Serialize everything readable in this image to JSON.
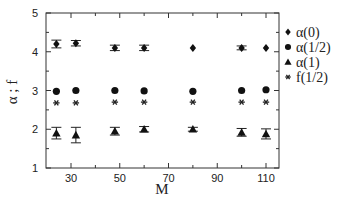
{
  "chart_data": {
    "type": "scatter",
    "title": "",
    "xlabel": "M",
    "ylabel": "α ; f",
    "xlim": [
      20,
      115
    ],
    "ylim": [
      1,
      5
    ],
    "x_ticks": [
      30,
      50,
      70,
      90,
      110
    ],
    "x_minor_ticks": [
      40,
      60,
      80,
      100
    ],
    "y_ticks": [
      1,
      2,
      3,
      4,
      5
    ],
    "grid": false,
    "legend_position": "right",
    "x": [
      24,
      32,
      48,
      60,
      80,
      100,
      110
    ],
    "series": [
      {
        "name": "α(0)",
        "marker": "diamond",
        "values": [
          4.2,
          4.22,
          4.1,
          4.1,
          4.1,
          4.1,
          4.1
        ],
        "errors": [
          0.1,
          0.07,
          0.07,
          0.07,
          0.03,
          0.05,
          0.03
        ]
      },
      {
        "name": "α(1/2)",
        "marker": "circle",
        "values": [
          2.98,
          3.0,
          3.0,
          2.99,
          2.98,
          3.0,
          3.02
        ],
        "errors": [
          0.02,
          0.02,
          0.02,
          0.02,
          0.02,
          0.02,
          0.02
        ]
      },
      {
        "name": "α(1)",
        "marker": "triangle",
        "values": [
          1.9,
          1.85,
          1.95,
          2.0,
          2.0,
          1.92,
          1.88
        ],
        "errors": [
          0.15,
          0.2,
          0.1,
          0.07,
          0.05,
          0.1,
          0.13
        ]
      },
      {
        "name": "f(1/2)",
        "marker": "asterisk",
        "values": [
          2.68,
          2.68,
          2.7,
          2.7,
          2.7,
          2.7,
          2.7
        ],
        "errors": [
          0.02,
          0.02,
          0.02,
          0.02,
          0.02,
          0.02,
          0.02
        ]
      }
    ]
  }
}
